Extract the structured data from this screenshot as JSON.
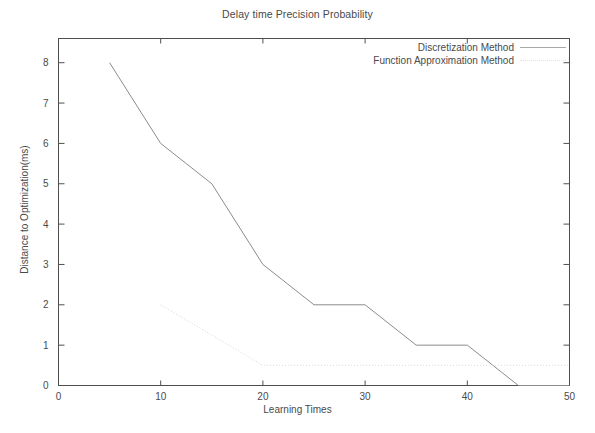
{
  "chart_data": {
    "type": "line",
    "title": "Delay time Precision Probability",
    "xlabel": "Learning Times",
    "ylabel": "Distance to Optimization(ms)",
    "xlim": [
      0,
      50
    ],
    "ylim": [
      0,
      8.6
    ],
    "xticks": [
      0,
      10,
      20,
      30,
      40,
      50
    ],
    "yticks": [
      0,
      1,
      2,
      3,
      4,
      5,
      6,
      7,
      8
    ],
    "xtick_labels": [
      "0",
      "10",
      "20",
      "30",
      "40",
      "50"
    ],
    "ytick_labels": [
      "0",
      "1",
      "2",
      "3",
      "4",
      "5",
      "6",
      "7",
      "8"
    ],
    "grid": false,
    "legend_position": "top-right",
    "series": [
      {
        "name": "Discretization Method",
        "style": "solid",
        "color": "#8c8c8c",
        "x": [
          5,
          10,
          15,
          20,
          25,
          30,
          35,
          40,
          45,
          50
        ],
        "y": [
          8,
          6,
          5,
          3,
          2,
          2,
          1,
          1,
          0,
          0
        ]
      },
      {
        "name": "Function Approximation Method",
        "style": "dotted",
        "color": "#d8d8d8",
        "x": [
          10,
          15,
          20,
          25,
          30,
          35,
          40,
          45,
          50
        ],
        "y": [
          2,
          1.25,
          0.5,
          0.5,
          0.5,
          0.5,
          0.5,
          0.5,
          0.5
        ]
      }
    ]
  },
  "legend": {
    "entries": [
      {
        "label": "Discretization Method",
        "style": "solid"
      },
      {
        "label": "Function Approximation Method",
        "style": "dotted"
      }
    ]
  }
}
